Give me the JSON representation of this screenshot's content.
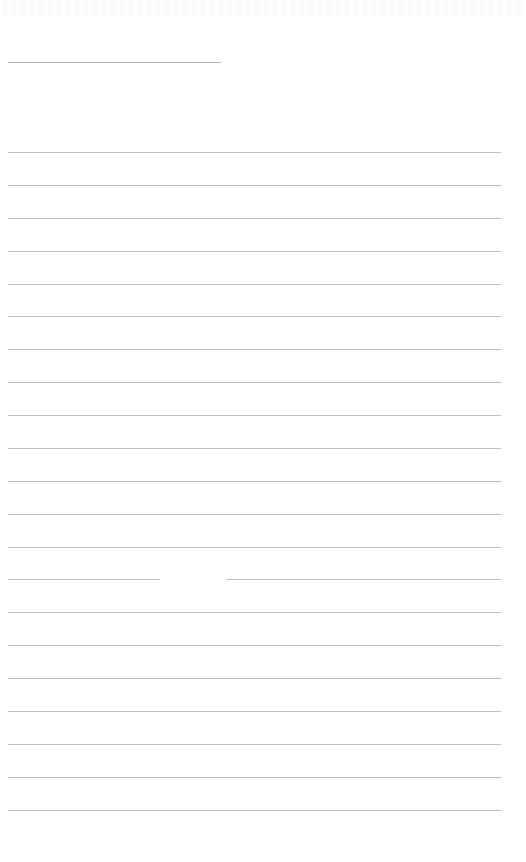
{
  "page": {
    "type": "lined-paper",
    "background_color": "#ffffff",
    "rule_color": "#bdbdbd",
    "header_rule": {
      "y": 62,
      "x_start": 8,
      "x_end": 221
    },
    "body_rules": {
      "x_start": 8,
      "x_end": 501,
      "y_positions": [
        152,
        185,
        218,
        251,
        284,
        316,
        349,
        382,
        415,
        448,
        481,
        514,
        547,
        579,
        612,
        645,
        678,
        711,
        744,
        777,
        810
      ]
    },
    "rule_gaps": [
      {
        "rule_index": 13,
        "x_start": 160,
        "x_end": 226
      }
    ],
    "text_content": []
  }
}
